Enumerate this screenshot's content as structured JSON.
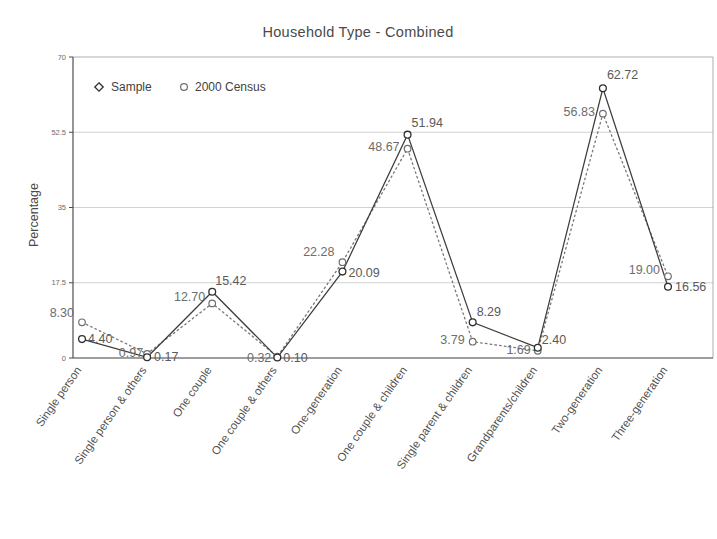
{
  "chart_data": {
    "type": "line",
    "title": "Household Type - Combined",
    "xlabel": "",
    "ylabel": "Percentage",
    "ylim": [
      0,
      70
    ],
    "yticks": [
      "0",
      "17.5",
      "35",
      "52.5",
      "70"
    ],
    "grid": true,
    "legend_position": "top-left",
    "categories": [
      "Single person",
      "Single person & others",
      "One couple",
      "One couple & others",
      "One-generation",
      "One couple & children",
      "Single parent & children",
      "Grandparents/children",
      "Two-generation",
      "Three-generation"
    ],
    "series": [
      {
        "name": "Sample",
        "marker": "diamond",
        "line_style": "solid",
        "values": [
          4.4,
          0.17,
          15.42,
          0.1,
          20.09,
          51.94,
          8.29,
          2.4,
          62.72,
          16.56
        ],
        "labels": [
          "4.40",
          "0.17",
          "15.42",
          "0.10",
          "20.09",
          "51.94",
          "8.29",
          "2.40",
          "62.72",
          "16.56"
        ]
      },
      {
        "name": "2000 Census",
        "marker": "circle",
        "line_style": "dotted",
        "values": [
          8.3,
          0.97,
          12.7,
          0.32,
          22.28,
          48.67,
          3.79,
          1.69,
          56.83,
          19.0
        ],
        "labels": [
          "8.30",
          "0.97",
          "12.70",
          "0.32",
          "22.28",
          "48.67",
          "3.79",
          "1.69",
          "56.83",
          "19.00"
        ]
      }
    ]
  },
  "legend": {
    "items": [
      {
        "label": "Sample",
        "marker": "diamond-marker-icon"
      },
      {
        "label": "2000 Census",
        "marker": "circle-marker-icon"
      }
    ]
  },
  "colors": {
    "sample_line": "#3d3d3d",
    "census_line": "#777777",
    "grid": "#bfbfbf",
    "axis": "#3f3f3f",
    "text": "#4a4a4a",
    "background": "#ffffff"
  }
}
